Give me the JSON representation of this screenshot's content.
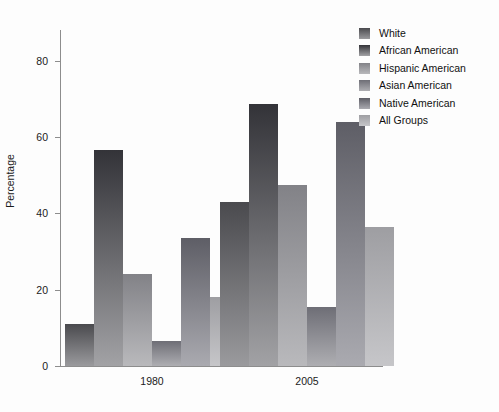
{
  "chart_data": {
    "type": "bar",
    "title": "",
    "xlabel": "",
    "ylabel": "Percentage",
    "categories": [
      "1980",
      "2005"
    ],
    "ylim": [
      0,
      88
    ],
    "yticks": [
      0,
      20,
      40,
      60,
      80
    ],
    "ytick_labels": [
      "0",
      "20",
      "40",
      "60",
      "80"
    ],
    "grid": false,
    "legend_position": "right",
    "series": [
      {
        "name": "White",
        "values": [
          11,
          43
        ],
        "color": "#56565a",
        "color_top": "#4a4a4e",
        "color_bottom": "#9a9a9d"
      },
      {
        "name": "African American",
        "values": [
          56.5,
          68.5
        ],
        "color": "#3a3a3e",
        "color_top": "#333338",
        "color_bottom": "#a2a2a5"
      },
      {
        "name": "Hispanic American",
        "values": [
          24,
          47.5
        ],
        "color": "#8c8c90",
        "color_top": "#828287",
        "color_bottom": "#b9b9bc"
      },
      {
        "name": "Asian American",
        "values": [
          6.5,
          15.5
        ],
        "color": "#787880",
        "color_top": "#6e6e76",
        "color_bottom": "#aeaeb2"
      },
      {
        "name": "Native American",
        "values": [
          33.5,
          64
        ],
        "color": "#6a6a70",
        "color_top": "#5e5e66",
        "color_bottom": "#aaaab0"
      },
      {
        "name": "All Groups",
        "values": [
          18,
          36.5
        ],
        "color": "#a9a9ad",
        "color_top": "#9e9ea2",
        "color_bottom": "#c6c6c9"
      }
    ]
  },
  "legend": {
    "items": [
      {
        "label": "White"
      },
      {
        "label": "African American"
      },
      {
        "label": "Hispanic American"
      },
      {
        "label": "Asian American"
      },
      {
        "label": "Native American"
      },
      {
        "label": "All Groups"
      }
    ]
  },
  "axes": {
    "y_title": "Percentage"
  }
}
